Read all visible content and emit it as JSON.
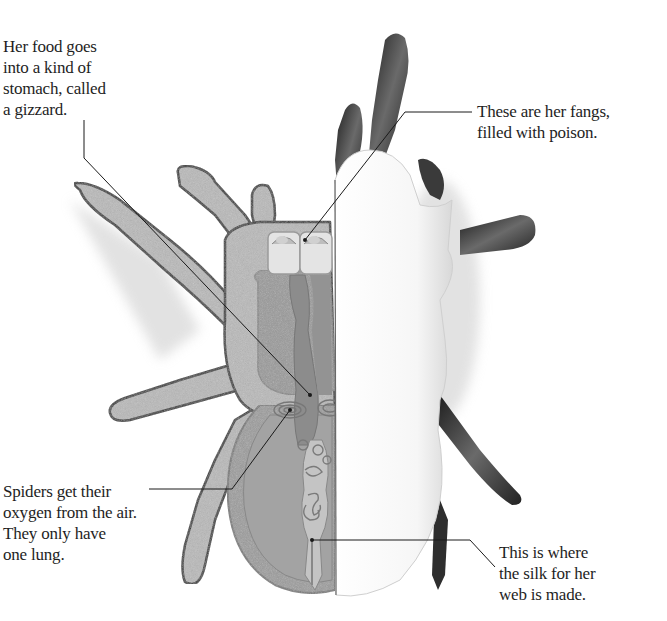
{
  "illustration": {
    "subject": "spider cross-section",
    "palette": {
      "background": "#ffffff",
      "leg_fill": "#b9b9b9",
      "leg_outline": "#3a3a3a",
      "body_outline": "#8a8a8a",
      "organ_fill": "#9a9a9a",
      "organ_dark": "#858585",
      "eye_fill": "#e6e6e6",
      "hairy_leg": "#2a2a2a",
      "leader_line": "#1a1a1a"
    }
  },
  "callouts": {
    "gizzard": {
      "lines": [
        "Her food goes",
        "into a kind of",
        "stomach, called",
        "a gizzard."
      ]
    },
    "fangs": {
      "lines": [
        "These are her fangs,",
        "filled with poison."
      ]
    },
    "lung": {
      "lines": [
        "Spiders get their",
        "oxygen from the air.",
        "They only have",
        "one lung."
      ]
    },
    "silk": {
      "lines": [
        "This is where",
        "the silk for her",
        "web is made."
      ]
    }
  }
}
